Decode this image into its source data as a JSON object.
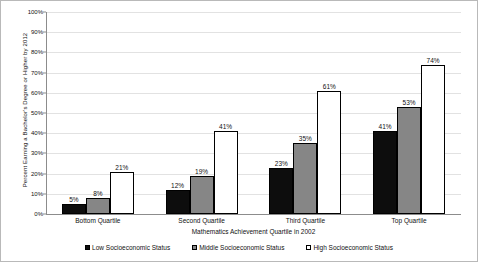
{
  "chart_data": {
    "type": "bar",
    "title": "",
    "xlabel": "Mathematics Achievement Quartile in 2002",
    "ylabel": "Percent Earning a Bachelor's Degree or Higher by 2012",
    "categories": [
      "Bottom Quartile",
      "Second Quartile",
      "Third Quartile",
      "Top Quartile"
    ],
    "series": [
      {
        "name": "Low Socioeconomic Status",
        "color": "#0d0d0d",
        "values": [
          5,
          12,
          23,
          41
        ],
        "labels": [
          "5%",
          "12%",
          "23%",
          "41%"
        ]
      },
      {
        "name": "Middle Socioeconomic Status",
        "color": "#868686",
        "values": [
          8,
          19,
          35,
          53
        ],
        "labels": [
          "8%",
          "19%",
          "35%",
          "53%"
        ]
      },
      {
        "name": "High Socioeconomic Status",
        "color": "#ffffff",
        "values": [
          21,
          41,
          61,
          74
        ],
        "labels": [
          "21%",
          "41%",
          "61%",
          "74%"
        ]
      }
    ],
    "ylim": [
      0,
      100
    ],
    "ytick_values": [
      0,
      10,
      20,
      30,
      40,
      50,
      60,
      70,
      80,
      90,
      100
    ],
    "ytick_labels": [
      "0%",
      "10%",
      "20%",
      "30%",
      "40%",
      "50%",
      "60%",
      "70%",
      "80%",
      "90%",
      "100%"
    ],
    "grid": true,
    "legend_position": "bottom"
  }
}
